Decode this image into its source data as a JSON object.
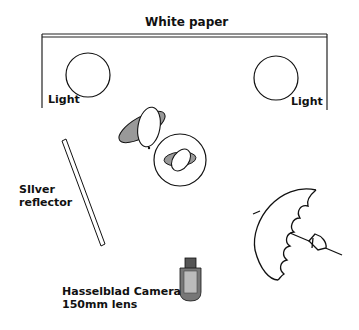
{
  "diagram": {
    "title": "White paper",
    "lights": [
      {
        "label": "Light",
        "position": "left"
      },
      {
        "label": "Light",
        "position": "right"
      }
    ],
    "reflector": {
      "line1": "SIlver",
      "line2": "reflector"
    },
    "camera": {
      "line1": "Hasselblad Camera",
      "line2": "150mm lens"
    },
    "colors": {
      "stroke": "#111111",
      "fill_gray": "#999999",
      "camera_dark": "#555555",
      "camera_light": "#bbbbbb"
    }
  }
}
